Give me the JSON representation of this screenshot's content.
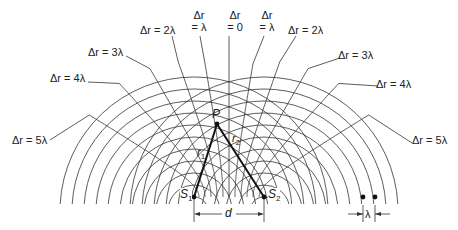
{
  "figure": {
    "sources": {
      "s1": {
        "label": "S",
        "sub": "1",
        "x": 194,
        "y": 197
      },
      "s2": {
        "label": "S",
        "sub": "2",
        "x": 264,
        "y": 197
      }
    },
    "point_p": {
      "label": "P",
      "x": 217,
      "y": 124
    },
    "r1_label": {
      "label": "r",
      "sub": "1"
    },
    "r2_label": {
      "label": "r",
      "sub": "2"
    },
    "separation_label": "d",
    "wavelength_label": "λ",
    "wavelength_px": 12,
    "num_wavefronts": 11,
    "wavelength_dots": [
      {
        "x": 363,
        "y": 197
      },
      {
        "x": 375,
        "y": 197
      }
    ],
    "colors": {
      "line": "#333333",
      "bold": "#111111",
      "text": "#222222",
      "background": "#ffffff"
    }
  },
  "labels": {
    "left_5": "Δr = 5λ",
    "left_4": "Δr = 4λ",
    "left_3": "Δr = 3λ",
    "left_2": "Δr = 2λ",
    "left_1_top": "Δr",
    "left_1_bottom": "= λ",
    "center_top": "Δr",
    "center_bottom": "= 0",
    "right_1_top": "Δr",
    "right_1_bottom": "= λ",
    "right_2": "Δr = 2λ",
    "right_3": "Δr = 3λ",
    "right_4": "Δr = 4λ",
    "right_5": "Δr = 5λ"
  },
  "hyperbolas": [
    {
      "n": -5,
      "label_x": 50,
      "label_y": 140
    },
    {
      "n": -4,
      "label_x": 88,
      "label_y": 82
    },
    {
      "n": -3,
      "label_x": 126,
      "label_y": 56
    },
    {
      "n": -2,
      "label_x": 172,
      "label_y": 36
    },
    {
      "n": -1,
      "label_x": 200,
      "label_y": 36
    },
    {
      "n": 0,
      "label_x": 229,
      "label_y": 36
    },
    {
      "n": 1,
      "label_x": 264,
      "label_y": 36
    },
    {
      "n": 2,
      "label_x": 296,
      "label_y": 36
    },
    {
      "n": 3,
      "label_x": 340,
      "label_y": 58
    },
    {
      "n": 4,
      "label_x": 378,
      "label_y": 86
    },
    {
      "n": 5,
      "label_x": 412,
      "label_y": 143
    }
  ]
}
